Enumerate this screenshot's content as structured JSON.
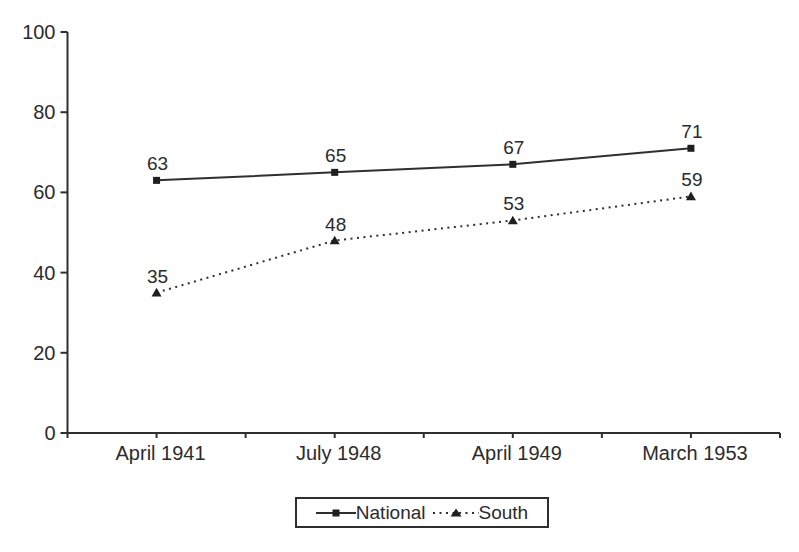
{
  "chart_data": {
    "type": "line",
    "categories": [
      "April 1941",
      "July 1948",
      "April 1949",
      "March 1953"
    ],
    "series": [
      {
        "name": "National",
        "values": [
          63,
          65,
          67,
          71
        ],
        "line_style": "solid",
        "marker": "square"
      },
      {
        "name": "South",
        "values": [
          35,
          48,
          53,
          59
        ],
        "line_style": "dotted",
        "marker": "triangle"
      }
    ],
    "title": "",
    "xlabel": "",
    "ylabel": "",
    "ylim": [
      0,
      100
    ],
    "yticks": [
      0,
      20,
      40,
      60,
      80,
      100
    ],
    "data_labels": true,
    "grid": false,
    "legend_position": "bottom-center",
    "line_color": "#2f2f2f",
    "marker_color": "#1f1f1f",
    "text_color": "#2b2b2b",
    "background_color": "#ffffff"
  }
}
